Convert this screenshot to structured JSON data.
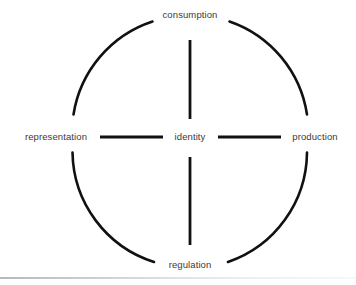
{
  "diagram": {
    "type": "cycle-diagram",
    "shape": "circle-with-cross-connectors",
    "stroke_color": "#111111",
    "text_color": "#3a3a3a",
    "background_color": "#ffffff",
    "center": {
      "x": 190,
      "y": 137
    },
    "radius": 117,
    "nodes": {
      "top": {
        "label": "consumption",
        "position": "top"
      },
      "left": {
        "label": "representation",
        "position": "left"
      },
      "center": {
        "label": "identity",
        "position": "center"
      },
      "right": {
        "label": "production",
        "position": "right"
      },
      "bottom": {
        "label": "regulation",
        "position": "bottom"
      }
    },
    "connectors": [
      {
        "name": "identity-to-consumption",
        "orientation": "vertical",
        "from": "identity",
        "to": "consumption"
      },
      {
        "name": "identity-to-regulation",
        "orientation": "vertical",
        "from": "identity",
        "to": "regulation"
      },
      {
        "name": "representation-to-identity",
        "orientation": "horizontal",
        "from": "representation",
        "to": "identity"
      },
      {
        "name": "identity-to-production",
        "orientation": "horizontal",
        "from": "identity",
        "to": "production"
      }
    ],
    "arcs": [
      {
        "name": "arc-top-left",
        "from": "representation",
        "to": "consumption"
      },
      {
        "name": "arc-top-right",
        "from": "consumption",
        "to": "production"
      },
      {
        "name": "arc-bottom-right",
        "from": "production",
        "to": "regulation"
      },
      {
        "name": "arc-bottom-left",
        "from": "regulation",
        "to": "representation"
      }
    ]
  }
}
